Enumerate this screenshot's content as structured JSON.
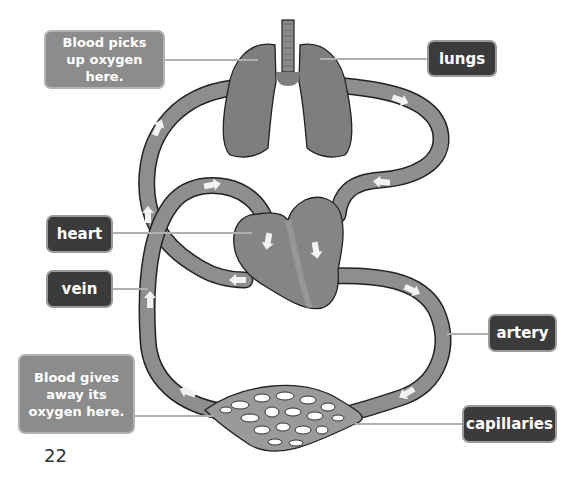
{
  "labels": {
    "note_lungs": "Blood picks up oxygen here.",
    "lungs": "lungs",
    "heart": "heart",
    "vein": "vein",
    "artery": "artery",
    "note_capillaries": "Blood gives away its oxygen here.",
    "capillaries": "capillaries"
  },
  "page_number": "22",
  "colors": {
    "vessel": "#8e8e8e",
    "organ": "#7e7e7e",
    "outline": "#222222",
    "label_dark": "#3b3b3b",
    "label_note": "#8c8c8c",
    "leader_line": "#b0b0b0",
    "arrow": "#f2f2f2"
  }
}
